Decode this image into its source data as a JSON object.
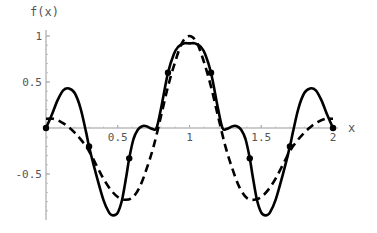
{
  "chart_data": {
    "type": "line",
    "title": "",
    "xlabel": "x",
    "ylabel": "f(x)",
    "xlim": [
      0,
      2.05
    ],
    "ylim": [
      -1.0,
      1.05
    ],
    "grid": false,
    "legend": null,
    "x_ticks": [
      {
        "value": 0.5,
        "label": "0.5"
      },
      {
        "value": 1,
        "label": "1"
      },
      {
        "value": 1.5,
        "label": "1.5"
      },
      {
        "value": 2,
        "label": "2"
      }
    ],
    "y_ticks": [
      {
        "value": 1,
        "label": "1"
      },
      {
        "value": 0.5,
        "label": "0.5"
      },
      {
        "value": -0.5,
        "label": "-0.5"
      }
    ],
    "series": [
      {
        "name": "approximation (solid)",
        "style": "solid",
        "color": "#000000",
        "x": [
          0,
          0.04,
          0.08,
          0.12,
          0.16,
          0.2,
          0.24,
          0.28,
          0.3,
          0.34,
          0.4,
          0.44,
          0.47,
          0.5,
          0.53,
          0.56,
          0.58,
          0.61,
          0.64,
          0.67,
          0.7,
          0.74,
          0.77,
          0.8,
          0.85,
          0.89,
          0.92,
          0.96,
          1.0,
          1.04,
          1.08,
          1.11,
          1.15,
          1.2,
          1.23,
          1.26,
          1.3,
          1.33,
          1.36,
          1.39,
          1.42,
          1.44,
          1.47,
          1.5,
          1.53,
          1.56,
          1.6,
          1.66,
          1.7,
          1.72,
          1.76,
          1.8,
          1.84,
          1.88,
          1.92,
          1.96,
          2.0
        ],
        "y": [
          0,
          0.14,
          0.3,
          0.41,
          0.43,
          0.38,
          0.22,
          -0.05,
          -0.2,
          -0.45,
          -0.78,
          -0.92,
          -0.95,
          -0.92,
          -0.78,
          -0.52,
          -0.33,
          -0.12,
          -0.02,
          0.02,
          0.02,
          -0.01,
          0.0,
          0.2,
          0.6,
          0.8,
          0.88,
          0.92,
          0.92,
          0.92,
          0.88,
          0.8,
          0.6,
          0.2,
          0.0,
          -0.01,
          0.02,
          0.02,
          -0.02,
          -0.12,
          -0.33,
          -0.52,
          -0.78,
          -0.92,
          -0.95,
          -0.92,
          -0.78,
          -0.45,
          -0.2,
          -0.05,
          0.22,
          0.38,
          0.43,
          0.41,
          0.3,
          0.14,
          0
        ]
      },
      {
        "name": "target function (dashed)",
        "style": "dashed",
        "color": "#000000",
        "x": [
          0,
          0.05,
          0.1,
          0.15,
          0.2,
          0.25,
          0.3,
          0.35,
          0.4,
          0.45,
          0.5,
          0.55,
          0.6,
          0.65,
          0.7,
          0.75,
          0.8,
          0.85,
          0.9,
          0.95,
          1.0,
          1.05,
          1.1,
          1.15,
          1.2,
          1.25,
          1.3,
          1.35,
          1.4,
          1.45,
          1.5,
          1.55,
          1.6,
          1.65,
          1.7,
          1.75,
          1.8,
          1.85,
          1.9,
          1.95,
          2.0
        ],
        "y": [
          0.1,
          0.1,
          0.07,
          0.02,
          -0.05,
          -0.14,
          -0.25,
          -0.4,
          -0.55,
          -0.67,
          -0.75,
          -0.78,
          -0.76,
          -0.65,
          -0.45,
          -0.2,
          0.12,
          0.45,
          0.72,
          0.93,
          1.0,
          0.93,
          0.72,
          0.45,
          0.12,
          -0.2,
          -0.45,
          -0.65,
          -0.76,
          -0.78,
          -0.75,
          -0.67,
          -0.55,
          -0.4,
          -0.25,
          -0.14,
          -0.05,
          0.02,
          0.07,
          0.1,
          0.1
        ]
      }
    ],
    "markers": {
      "series": "approximation (solid)",
      "points": [
        {
          "x": 0,
          "y": 0
        },
        {
          "x": 0.3,
          "y": -0.2
        },
        {
          "x": 0.58,
          "y": -0.33
        },
        {
          "x": 0.85,
          "y": 0.6
        },
        {
          "x": 1.15,
          "y": 0.6
        },
        {
          "x": 1.42,
          "y": -0.33
        },
        {
          "x": 1.7,
          "y": -0.2
        },
        {
          "x": 2.0,
          "y": 0
        }
      ]
    }
  },
  "axes": {
    "x_label": "x",
    "y_label": "f(x)"
  }
}
